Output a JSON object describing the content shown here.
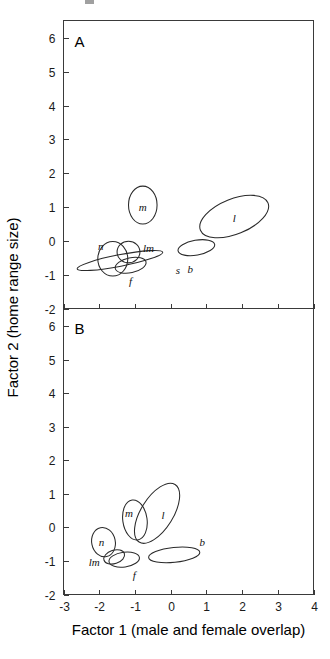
{
  "figure": {
    "title": "",
    "panels": [
      "A",
      "B"
    ]
  },
  "axes": {
    "x_title": "Factor 1 (male and female overlap)",
    "y_title": "Factor 2 (home range size)",
    "x_ticks": [
      "-3",
      "-2",
      "-1",
      "0",
      "1",
      "2",
      "3",
      "4"
    ],
    "y_ticks": [
      "6",
      "5",
      "4",
      "3",
      "2",
      "1",
      "0",
      "-1",
      "-2"
    ]
  },
  "panelA": {
    "letter": "A",
    "labels": {
      "m": "m",
      "l": "l",
      "lm": "lm",
      "n": "n",
      "f": "f",
      "s": "s",
      "b": "b"
    }
  },
  "panelB": {
    "letter": "B",
    "labels": {
      "m": "m",
      "l": "l",
      "n": "n",
      "lm": "lm",
      "f": "f",
      "b": "b"
    }
  },
  "chart_data": {
    "type": "scatter",
    "title": "",
    "subtitle": "",
    "xlabel": "Factor 1 (male and female overlap)",
    "ylabel": "Factor 2 (home range size)",
    "xlim": [
      -3,
      4
    ],
    "ylim": [
      -2,
      6.5
    ],
    "xticks": [
      -3,
      -2,
      -1,
      0,
      1,
      2,
      3,
      4
    ],
    "yticks": [
      -2,
      -1,
      0,
      1,
      2,
      3,
      4,
      5,
      6
    ],
    "grid": false,
    "legend": null,
    "marker_style": "confidence-ellipse-outline",
    "panels": [
      {
        "panel": "A",
        "annotation": "A",
        "ellipses": [
          {
            "label": "m",
            "cx": -0.78,
            "cy": 1.06,
            "rx": 0.4,
            "ry": 0.56,
            "angle": 0
          },
          {
            "label": "l",
            "cx": 1.78,
            "cy": 0.72,
            "rx": 1.02,
            "ry": 0.52,
            "angle": -22
          },
          {
            "label": "b",
            "cx": 0.72,
            "cy": -0.2,
            "rx": 0.52,
            "ry": 0.22,
            "angle": -10
          },
          {
            "label": "n",
            "cx": -1.62,
            "cy": -0.53,
            "rx": 0.42,
            "ry": 0.51,
            "angle": 0
          },
          {
            "label": "lm",
            "cx": -1.18,
            "cy": -0.33,
            "rx": 0.32,
            "ry": 0.32,
            "angle": 0
          },
          {
            "label": "f",
            "cx": -1.12,
            "cy": -0.72,
            "rx": 0.44,
            "ry": 0.22,
            "angle": -12
          },
          {
            "label": "s",
            "cx": -1.42,
            "cy": -0.58,
            "rx": 1.22,
            "ry": 0.17,
            "angle": -11
          }
        ]
      },
      {
        "panel": "B",
        "annotation": "B",
        "ellipses": [
          {
            "label": "l",
            "cx": -0.38,
            "cy": 0.42,
            "rx": 0.95,
            "ry": 0.48,
            "angle": -58
          },
          {
            "label": "m",
            "cx": -1.0,
            "cy": 0.22,
            "rx": 0.34,
            "ry": 0.6,
            "angle": -8
          },
          {
            "label": "n",
            "cx": -1.88,
            "cy": -0.44,
            "rx": 0.33,
            "ry": 0.44,
            "angle": -12
          },
          {
            "label": "lm",
            "cx": -1.58,
            "cy": -0.88,
            "rx": 0.3,
            "ry": 0.2,
            "angle": -18
          },
          {
            "label": "f",
            "cx": -1.3,
            "cy": -0.96,
            "rx": 0.43,
            "ry": 0.22,
            "angle": -8
          },
          {
            "label": "b",
            "cx": 0.1,
            "cy": -0.82,
            "rx": 0.72,
            "ry": 0.22,
            "angle": -6
          }
        ]
      }
    ]
  }
}
